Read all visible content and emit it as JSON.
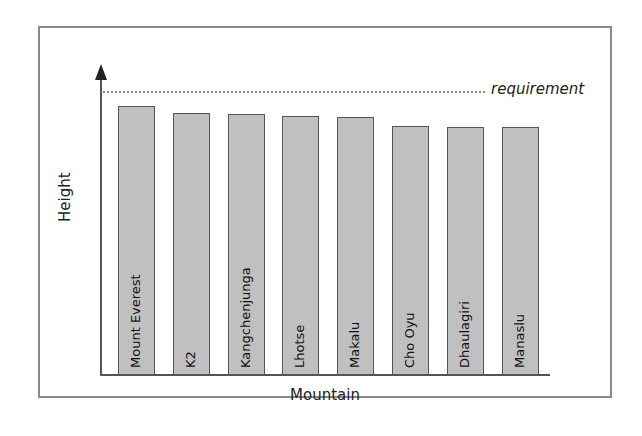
{
  "chart_data": {
    "type": "bar",
    "title": "",
    "xlabel": "Mountain",
    "ylabel": "Height",
    "categories": [
      "Mount Everest",
      "K2",
      "Kangchenjunga",
      "Lhotse",
      "Makalu",
      "Cho Oyu",
      "Dhaulagiri",
      "Manaslu"
    ],
    "values": [
      8849,
      8611,
      8586,
      8516,
      8485,
      8188,
      8167,
      8163
    ],
    "reference_line": {
      "label": "requirement",
      "value": 9350,
      "style": "dotted"
    },
    "ylim": [
      0,
      10100
    ],
    "grid": false,
    "y_ticks_shown": false,
    "bar_color": "#c0c0c0",
    "bar_edge_color": "#555555"
  },
  "labels": {
    "requirement": "requirement",
    "xaxis": "Mountain",
    "yaxis": "Height"
  }
}
